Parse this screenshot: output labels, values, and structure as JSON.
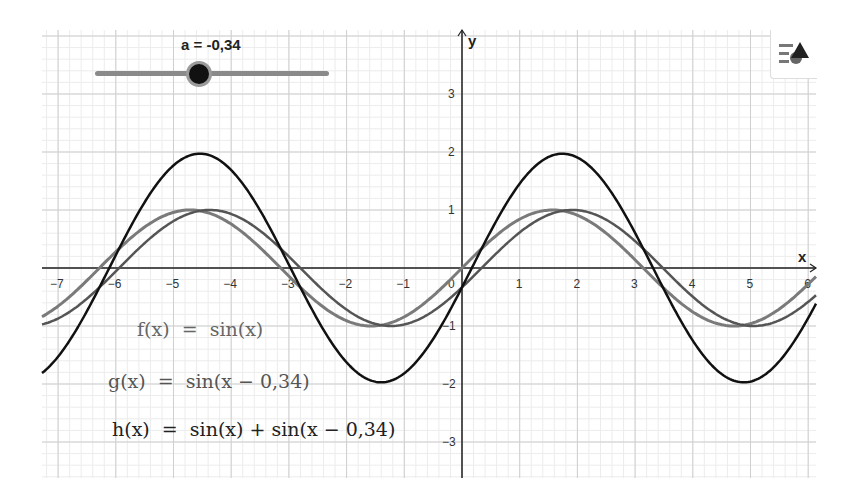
{
  "slider": {
    "label": "a = -0,34",
    "value": -0.34
  },
  "style_button": {
    "icon": "style-bar-icon"
  },
  "formulas": {
    "f": "f(x)  =  sin(x)",
    "g": "g(x)  =  sin(x − 0,34)",
    "h": "h(x)  =  sin(x) + sin(x − 0,34)"
  },
  "colors": {
    "f": "#7a7a7a",
    "g": "#555555",
    "h": "#111111",
    "axis": "#222222",
    "grid_major": "#cfcfcf",
    "grid_minor": "#ececec"
  },
  "chart_data": {
    "type": "line",
    "title": "",
    "xlabel": "x",
    "ylabel": "y",
    "xlim": [
      -7.4,
      6.1
    ],
    "ylim": [
      -3.6,
      4.1
    ],
    "x_ticks": [
      "-7",
      "-6",
      "-5",
      "-4",
      "-3",
      "-2",
      "-1",
      "0",
      "1",
      "2",
      "3",
      "4",
      "5",
      "6"
    ],
    "y_ticks": [
      "-3",
      "-2",
      "-1",
      "1",
      "2",
      "3"
    ],
    "grid": true,
    "parameter": {
      "name": "a",
      "value": -0.34
    },
    "series": [
      {
        "name": "f(x) = sin(x)",
        "expression": "sin(x)",
        "amplitude": 1,
        "phase_shift": 0
      },
      {
        "name": "g(x) = sin(x − 0,34)",
        "expression": "sin(x - 0.34)",
        "amplitude": 1,
        "phase_shift": 0.34
      },
      {
        "name": "h(x) = sin(x) + sin(x − 0,34)",
        "expression": "sin(x) + sin(x - 0.34)",
        "amplitude": 1.97,
        "phase_shift": 0.17
      }
    ]
  }
}
